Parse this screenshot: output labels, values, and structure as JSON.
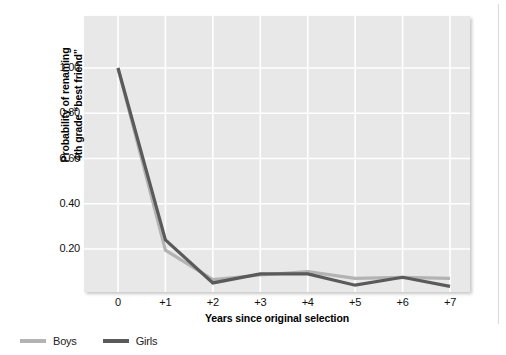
{
  "chart_data": {
    "type": "line",
    "title": "",
    "xlabel": "Years since original selection",
    "ylabel": "Probability of renaming 4th grade “best friend”",
    "categories": [
      "0",
      "+1",
      "+2",
      "+3",
      "+4",
      "+5",
      "+6",
      "+7"
    ],
    "x": [
      0,
      1,
      2,
      3,
      4,
      5,
      6,
      7
    ],
    "xlim": [
      -0.3,
      7.5
    ],
    "ylim": [
      0.0,
      1.13
    ],
    "yticks": [
      1.0,
      0.8,
      0.6,
      0.4,
      0.2
    ],
    "ytick_labels": [
      "1.00",
      "0.80",
      "0.60",
      "0.40",
      "0.20"
    ],
    "grid": true,
    "grid_color": "#ffffff",
    "plot_background": "#e8e8e8",
    "legend_position": "below-left",
    "series": [
      {
        "name": "Boys",
        "color": "#b3b3b3",
        "values": [
          1.0,
          0.195,
          0.065,
          0.085,
          0.1,
          0.07,
          0.075,
          0.07
        ]
      },
      {
        "name": "Girls",
        "color": "#5a5a5a",
        "values": [
          1.0,
          0.24,
          0.05,
          0.09,
          0.09,
          0.04,
          0.075,
          0.035
        ]
      }
    ]
  },
  "axis": {
    "y_title_line1": "Probability of renaming",
    "y_title_line2": "4th grade “best friend”",
    "x_title": "Years since original selection",
    "y_tick_labels": [
      "1.00",
      "0.80",
      "0.60",
      "0.40",
      "0.20"
    ],
    "x_tick_labels": [
      "0",
      "+1",
      "+2",
      "+3",
      "+4",
      "+5",
      "+6",
      "+7"
    ]
  },
  "legend": {
    "items": [
      {
        "label": "Boys",
        "color": "#b3b3b3"
      },
      {
        "label": "Girls",
        "color": "#5a5a5a"
      }
    ]
  }
}
